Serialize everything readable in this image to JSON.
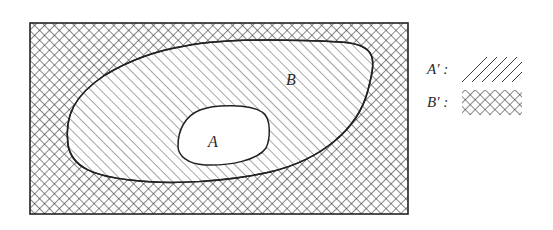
{
  "diagram": {
    "type": "venn-complement",
    "universe_frame": {
      "x": 30,
      "y": 23,
      "width": 378,
      "height": 191
    },
    "sets": [
      {
        "id": "A",
        "label": "A",
        "relation": "subset of B",
        "fill": "white"
      },
      {
        "id": "B",
        "label": "B",
        "relation": "superset of A",
        "fill": "diagonal-hatch outside A"
      }
    ],
    "regions": {
      "A_prime": {
        "description": "everything outside A",
        "pattern": "diagonal-hatch"
      },
      "B_prime": {
        "description": "everything outside B",
        "pattern": "cross-hatch"
      }
    }
  },
  "labels": {
    "set_a": "A",
    "set_b": "B"
  },
  "legend": {
    "items": [
      {
        "label": "A′ :",
        "pattern": "diagonal-hatch"
      },
      {
        "label": "B′ :",
        "pattern": "cross-hatch"
      }
    ]
  },
  "colors": {
    "ink": "#2a2a2a",
    "background": "#ffffff"
  }
}
